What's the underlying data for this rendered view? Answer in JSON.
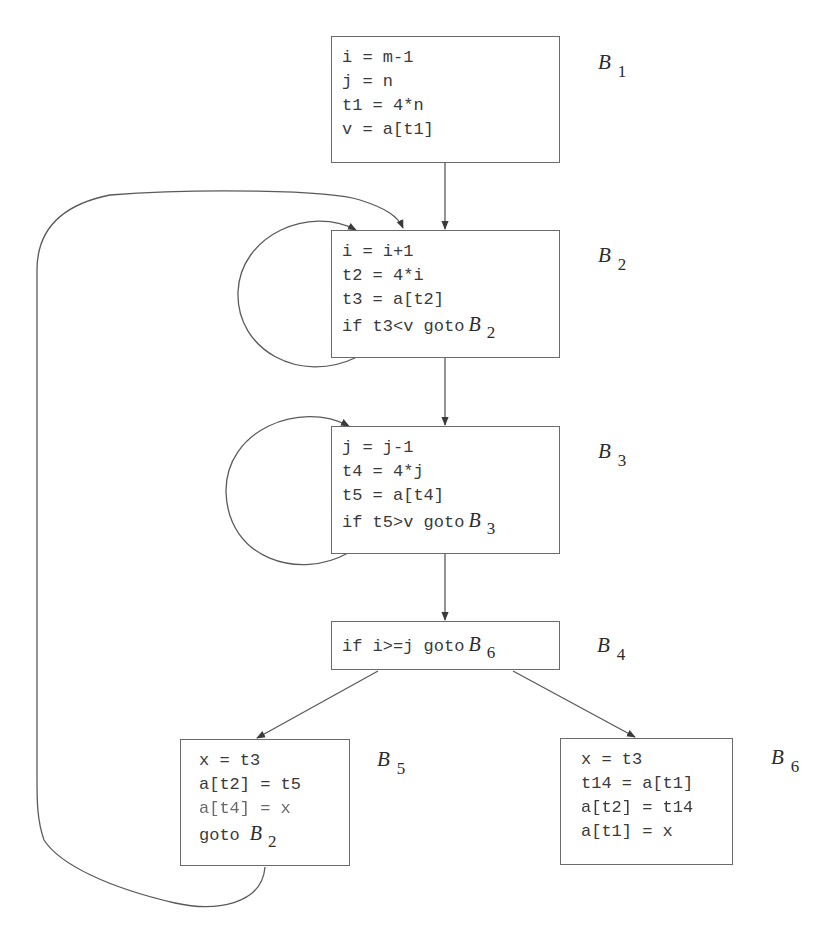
{
  "diagram": {
    "type": "control-flow-graph",
    "stroke_color": "#5a5a5a",
    "blocks": [
      {
        "id": "B1",
        "label": {
          "letter": "B",
          "subscript": "1"
        },
        "lines": [
          {
            "text": "i = m-1"
          },
          {
            "text": "j = n"
          },
          {
            "text": "t1 = 4*n"
          },
          {
            "text": "v = a[t1]"
          }
        ]
      },
      {
        "id": "B2",
        "label": {
          "letter": "B",
          "subscript": "2"
        },
        "lines": [
          {
            "text": "i = i+1"
          },
          {
            "text": "t2 = 4*i"
          },
          {
            "text": "t3 = a[t2]"
          },
          {
            "text": "if t3<v goto",
            "ref": {
              "letter": "B",
              "subscript": "2"
            }
          }
        ]
      },
      {
        "id": "B3",
        "label": {
          "letter": "B",
          "subscript": "3"
        },
        "lines": [
          {
            "text": "j = j-1"
          },
          {
            "text": "t4 = 4*j"
          },
          {
            "text": "t5 = a[t4]"
          },
          {
            "text": "if t5>v goto",
            "ref": {
              "letter": "B",
              "subscript": "3"
            }
          }
        ]
      },
      {
        "id": "B4",
        "label": {
          "letter": "B",
          "subscript": "4"
        },
        "lines": [
          {
            "text": "if i>=j goto",
            "ref": {
              "letter": "B",
              "subscript": "6"
            }
          }
        ]
      },
      {
        "id": "B5",
        "label": {
          "letter": "B",
          "subscript": "5"
        },
        "lines": [
          {
            "text": "x = t3"
          },
          {
            "text": "a[t2] = t5"
          },
          {
            "text": "a[t4] = x"
          },
          {
            "text": "goto",
            "ref": {
              "letter": "B",
              "subscript": "2"
            }
          }
        ]
      },
      {
        "id": "B6",
        "label": {
          "letter": "B",
          "subscript": "6"
        },
        "lines": [
          {
            "text": "x = t3"
          },
          {
            "text": "t14 = a[t1]"
          },
          {
            "text": "a[t2] = t14"
          },
          {
            "text": "a[t1] = x"
          }
        ]
      }
    ],
    "edges": [
      {
        "from": "B1",
        "to": "B2"
      },
      {
        "from": "B2",
        "to": "B2",
        "kind": "self-loop"
      },
      {
        "from": "B2",
        "to": "B3"
      },
      {
        "from": "B3",
        "to": "B3",
        "kind": "self-loop"
      },
      {
        "from": "B3",
        "to": "B4"
      },
      {
        "from": "B4",
        "to": "B5"
      },
      {
        "from": "B4",
        "to": "B6"
      },
      {
        "from": "B5",
        "to": "B2",
        "kind": "back-edge"
      }
    ]
  }
}
